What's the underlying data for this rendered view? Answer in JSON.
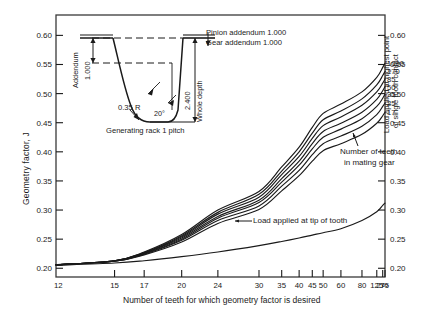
{
  "chart_data": {
    "type": "line",
    "title": "",
    "xlabel": "Number of teeth for which geometry factor is desired",
    "ylabel": "Geometry factor,  J",
    "ylabel_right_line1": "Load applied at highest point",
    "ylabel_right_line2": "of single tooth contact",
    "xticks": [
      "12",
      "15",
      "17",
      "20",
      "24",
      "30",
      "35",
      "40",
      "45",
      "50",
      "60",
      "80",
      "125",
      "275",
      "∞"
    ],
    "xtick_positions": [
      0,
      0.178,
      0.268,
      0.382,
      0.492,
      0.617,
      0.686,
      0.739,
      0.779,
      0.812,
      0.866,
      0.93,
      0.975,
      0.993,
      1.0
    ],
    "yticks": [
      "0.20",
      "0.25",
      "0.30",
      "0.35",
      "0.40",
      "0.45",
      "0.50",
      "0.55",
      "0.60"
    ],
    "ylim": [
      0.185,
      0.635
    ],
    "grid": false,
    "legend_position": "curve-end-labels",
    "series": [
      {
        "name": "1000",
        "label": "1000",
        "values": [
          0.206,
          0.213,
          0.228,
          0.258,
          0.3,
          0.332,
          0.374,
          0.408,
          0.442,
          0.466,
          0.482,
          0.503,
          0.528,
          0.545,
          0.552
        ]
      },
      {
        "name": "170",
        "label": "170",
        "values": [
          0.206,
          0.213,
          0.227,
          0.256,
          0.296,
          0.327,
          0.367,
          0.4,
          0.432,
          0.455,
          0.47,
          0.491,
          0.515,
          0.531,
          0.538
        ]
      },
      {
        "name": "85",
        "label": "85",
        "values": [
          0.206,
          0.213,
          0.226,
          0.254,
          0.293,
          0.322,
          0.361,
          0.392,
          0.423,
          0.445,
          0.46,
          0.48,
          0.503,
          0.518,
          0.525
        ]
      },
      {
        "name": "50",
        "label": "50",
        "values": [
          0.206,
          0.213,
          0.226,
          0.252,
          0.289,
          0.317,
          0.354,
          0.384,
          0.414,
          0.435,
          0.449,
          0.468,
          0.49,
          0.505,
          0.512
        ]
      },
      {
        "name": "35",
        "label": "35",
        "values": [
          0.206,
          0.212,
          0.225,
          0.25,
          0.286,
          0.313,
          0.348,
          0.377,
          0.405,
          0.425,
          0.439,
          0.457,
          0.478,
          0.492,
          0.499
        ]
      },
      {
        "name": "25",
        "label": "25",
        "values": [
          0.206,
          0.212,
          0.224,
          0.248,
          0.282,
          0.307,
          0.341,
          0.368,
          0.395,
          0.414,
          0.427,
          0.444,
          0.464,
          0.478,
          0.484
        ]
      },
      {
        "name": "17",
        "label": "17",
        "values": [
          0.206,
          0.212,
          0.223,
          0.245,
          0.277,
          0.301,
          0.333,
          0.359,
          0.384,
          0.402,
          0.414,
          0.43,
          0.449,
          0.462,
          0.468
        ]
      },
      {
        "name": "tip",
        "label": "",
        "values": [
          0.205,
          0.209,
          0.213,
          0.22,
          0.228,
          0.239,
          0.246,
          0.252,
          0.257,
          0.261,
          0.268,
          0.282,
          0.297,
          0.308,
          0.312
        ]
      }
    ],
    "annotations": [
      {
        "name": "load-tip-annotation",
        "text": "Load applied at tip of tooth"
      },
      {
        "name": "mating-gear-annotation-line1",
        "text": "Number of teeth"
      },
      {
        "name": "mating-gear-annotation-line2",
        "text": "in mating gear"
      }
    ]
  },
  "inset": {
    "caption": "Generating rack  1 pitch",
    "addendum_label": "Addendum",
    "addendum_value": "1.000",
    "whole_depth_label": "Whole depth",
    "whole_depth_value": "2.400",
    "fillet_radius": "0.35 R",
    "pressure_angle": "20°",
    "pinion_addendum": "Pinion addendum 1.000",
    "gear_addendum": "Gear addendum    1.000"
  },
  "colors": {
    "ink": "#1a1a1a",
    "frame": "#3a3a3a",
    "background": "#ffffff"
  }
}
